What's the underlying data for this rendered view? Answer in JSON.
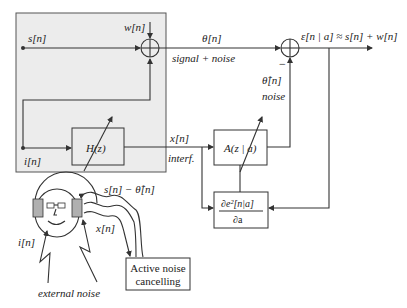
{
  "diagram": {
    "colors": {
      "shaded_region": "#ececec",
      "line": "#333333",
      "earcup": "#b0b0b0"
    },
    "signals": {
      "s": "s[n]",
      "w": "w[n]",
      "theta": "θ[n]",
      "theta_caption": "signal + noise",
      "i": "i[n]",
      "x": "x[n]",
      "x_caption": "interf.",
      "theta_hat": "θ̂[n]",
      "theta_hat_caption": "noise",
      "minus_sign": "−",
      "error_output": "ε[n | a] ≈ s[n] + w[n]"
    },
    "blocks": {
      "H": "H(z)",
      "A": "A(z | a)",
      "gradient_numerator": "∂e²[n|a]",
      "gradient_denominator": "∂a",
      "anc": [
        "Active noise",
        "cancelling"
      ]
    },
    "illustration": {
      "head_signal_out": "s[n] − θ̂[n]",
      "head_x": "x[n]",
      "head_i": "i[n]",
      "external_noise": "external noise"
    }
  }
}
